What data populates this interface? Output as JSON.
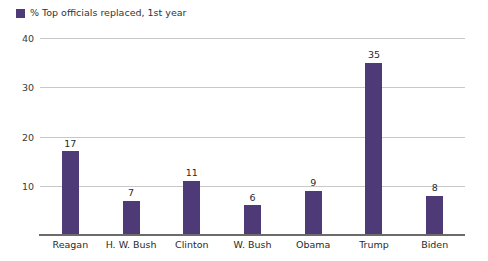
{
  "legend": {
    "swatch_color": "#4f3a78",
    "label": "% Top officials replaced, 1st year"
  },
  "chart_data": {
    "type": "bar",
    "title": "",
    "subtitle": "",
    "xlabel": "",
    "ylabel": "",
    "categories": [
      "Reagan",
      "H. W. Bush",
      "Clinton",
      "W. Bush",
      "Obama",
      "Trump",
      "Biden"
    ],
    "values": [
      17,
      7,
      11,
      6,
      9,
      35,
      8
    ],
    "series": [
      {
        "name": "% Top officials replaced, 1st year",
        "color": "#4f3a78",
        "values": [
          17,
          7,
          11,
          6,
          9,
          35,
          8
        ]
      }
    ],
    "ylim": [
      0,
      40
    ],
    "yticks": [
      10,
      20,
      30,
      40
    ],
    "ytick_labels": [
      "10",
      "20",
      "30",
      "40"
    ],
    "grid": true,
    "legend_position": "top-left",
    "data_labels": [
      "17",
      "7",
      "11",
      "6",
      "9",
      "35",
      "8"
    ],
    "bar_color": "#4f3a78",
    "gridline_color": "#c8c8c8",
    "axis_color": "#6b6b6b",
    "background": "#ffffff"
  }
}
